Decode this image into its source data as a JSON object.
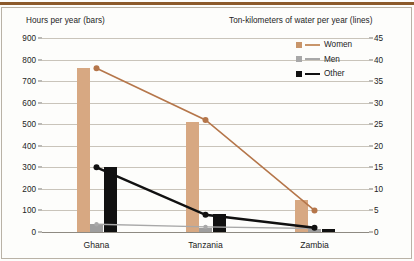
{
  "axis_captions": {
    "left": "Hours per year (bars)",
    "right": "Ton-kilometers of water per year (lines)"
  },
  "legend": {
    "items": [
      {
        "label": "Women",
        "color": "#c8956a"
      },
      {
        "label": "Men",
        "color": "#a8a8a8"
      },
      {
        "label": "Other",
        "color": "#111111"
      }
    ]
  },
  "colors": {
    "women": "#d7a882",
    "men": "#9e9e9e",
    "other": "#111111",
    "women_line": "#b5764a",
    "men_line": "#a8a8a8",
    "other_line": "#111111",
    "top_rule": "#8c5a2b",
    "grid": "#c9c4ba",
    "frame": "#b9b2a6"
  },
  "chart_data": {
    "type": "bar",
    "title": "",
    "categories": [
      "Ghana",
      "Tanzania",
      "Zambia"
    ],
    "xlabel": "",
    "ylabel": "Hours per year (bars)",
    "y2label": "Ton-kilometers of water per year (lines)",
    "ylim": [
      0,
      900
    ],
    "y2lim": [
      0,
      45
    ],
    "yticks": [
      0,
      100,
      200,
      300,
      400,
      500,
      600,
      700,
      800,
      900
    ],
    "y2ticks": [
      0,
      5,
      10,
      15,
      20,
      25,
      30,
      35,
      40,
      45
    ],
    "grid": true,
    "legend_position": "top-right",
    "bar_series": [
      {
        "name": "Women",
        "axis": "left",
        "values": [
          760,
          510,
          150
        ]
      },
      {
        "name": "Men",
        "axis": "left",
        "values": [
          35,
          20,
          15
        ]
      },
      {
        "name": "Other",
        "axis": "left",
        "values": [
          300,
          85,
          15
        ]
      }
    ],
    "line_series": [
      {
        "name": "Women",
        "axis": "right",
        "values": [
          38,
          26,
          5
        ]
      },
      {
        "name": "Men",
        "axis": "right",
        "values": [
          1.8,
          1.2,
          0.8
        ]
      },
      {
        "name": "Other",
        "axis": "right",
        "values": [
          15,
          4,
          1
        ]
      }
    ]
  }
}
